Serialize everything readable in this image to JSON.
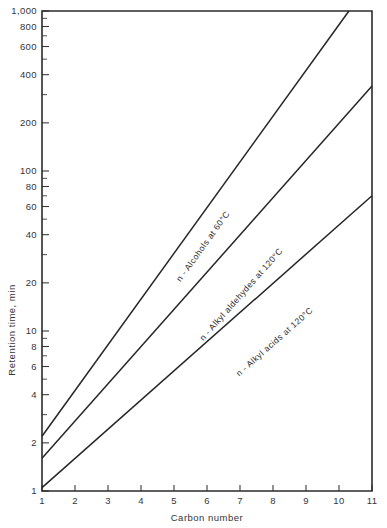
{
  "chart_data": {
    "type": "line",
    "title": "",
    "xlabel": "Carbon number",
    "ylabel": "Retention time, min",
    "xlim": [
      1,
      11
    ],
    "ylim": [
      1,
      1000
    ],
    "yscale": "log",
    "xscale": "linear",
    "grid": false,
    "legend": "inline-curve-labels",
    "x_ticks": [
      "1",
      "2",
      "3",
      "4",
      "5",
      "6",
      "7",
      "8",
      "9",
      "10",
      "11"
    ],
    "x_tick_values": [
      1,
      2,
      3,
      4,
      5,
      6,
      7,
      8,
      9,
      10,
      11
    ],
    "y_ticks": [
      "1",
      "2",
      "4",
      "6",
      "8",
      "10",
      "20",
      "40",
      "60",
      "80",
      "100",
      "200",
      "400",
      "600",
      "800",
      "1,000"
    ],
    "y_tick_values": [
      1,
      2,
      4,
      6,
      8,
      10,
      20,
      40,
      60,
      80,
      100,
      200,
      400,
      600,
      800,
      1000
    ],
    "y_minor_values": [
      3,
      5,
      7,
      9,
      30,
      50,
      70,
      90,
      300,
      500,
      700,
      900
    ],
    "series": [
      {
        "name": "n - Alcohols at 60°C",
        "label": "n - Alcohols at 60°C",
        "label_anchor_x": 5.95,
        "label_anchor_y": 33.0,
        "color": "#262626",
        "x": [
          1,
          10.3
        ],
        "values": [
          2.2,
          1000
        ]
      },
      {
        "name": "n - Alkyl aldehydes at 120°C",
        "label": "n - Alkyl aldehydes at 120°C",
        "label_anchor_x": 7.1,
        "label_anchor_y": 16.5,
        "color": "#262626",
        "x": [
          1,
          11
        ],
        "values": [
          1.6,
          340
        ]
      },
      {
        "name": "n - Alkyl acids at 120°C",
        "label": "n - Alkyl acids at 120°C",
        "label_anchor_x": 8.1,
        "label_anchor_y": 8.3,
        "color": "#262626",
        "x": [
          1,
          11
        ],
        "values": [
          1.05,
          70
        ]
      }
    ]
  }
}
